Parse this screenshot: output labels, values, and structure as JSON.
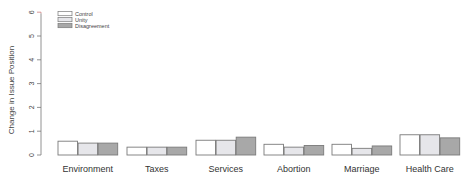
{
  "chart_data": {
    "type": "bar",
    "title": "",
    "xlabel": "",
    "ylabel": "Change in Issue Position",
    "ylim": [
      0,
      6
    ],
    "yticks": [
      0,
      1,
      2,
      3,
      4,
      5,
      6
    ],
    "grid": false,
    "legend_position": "top-left",
    "categories": [
      "Environment",
      "Taxes",
      "Services",
      "Abortion",
      "Marriage",
      "Health Care"
    ],
    "series": [
      {
        "name": "Control",
        "color": "#ffffff",
        "values": [
          0.58,
          0.33,
          0.62,
          0.45,
          0.45,
          0.85
        ]
      },
      {
        "name": "Unity",
        "color": "#e6e6ea",
        "values": [
          0.5,
          0.33,
          0.62,
          0.33,
          0.28,
          0.85
        ]
      },
      {
        "name": "Disagreement",
        "color": "#a8a8a8",
        "values": [
          0.5,
          0.33,
          0.75,
          0.4,
          0.38,
          0.72
        ]
      }
    ]
  },
  "colors": {
    "bar_stroke": "#7a7a7a",
    "axis": "#777777",
    "axis_top_accent": "#d08080"
  }
}
